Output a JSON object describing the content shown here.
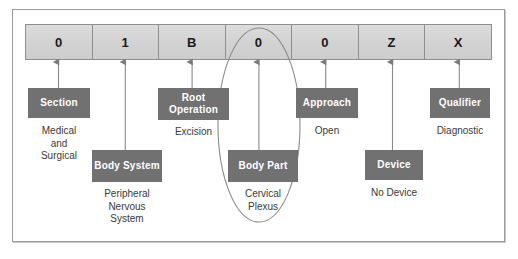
{
  "diagram": {
    "colors": {
      "box_fill": "#717171",
      "box_text": "#ffffff",
      "cell_fill": "#d6d6d6",
      "cell_text": "#1a1a1a",
      "frame_border": "#9a9a9a",
      "line": "#808080",
      "caption_text": "#3a3a3a"
    },
    "code_cells": [
      {
        "char": "0"
      },
      {
        "char": "1"
      },
      {
        "char": "B"
      },
      {
        "char": "0"
      },
      {
        "char": "0"
      },
      {
        "char": "Z"
      },
      {
        "char": "X"
      }
    ],
    "positions": [
      {
        "box_label": "Section",
        "caption": "Medical\nand\nSurgical",
        "row": "upper"
      },
      {
        "box_label": "Body\nSystem",
        "caption": "Peripheral\nNervous\nSystem",
        "row": "lower"
      },
      {
        "box_label": "Root\nOperation",
        "caption": "Excision",
        "row": "upper"
      },
      {
        "box_label": "Body Part",
        "caption": "Cervical\nPlexus",
        "row": "lower",
        "highlighted": true
      },
      {
        "box_label": "Approach",
        "caption": "Open",
        "row": "upper"
      },
      {
        "box_label": "Device",
        "caption": "No Device",
        "row": "lower"
      },
      {
        "box_label": "Qualifier",
        "caption": "Diagnostic",
        "row": "upper"
      }
    ]
  }
}
